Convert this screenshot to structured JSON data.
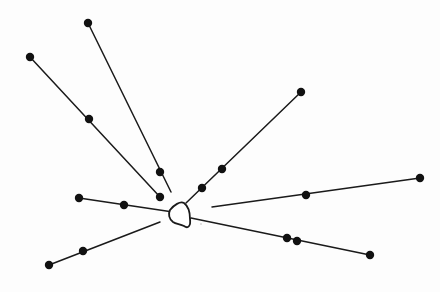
{
  "diagram": {
    "title": "",
    "width": 440,
    "height": 292,
    "background": "#fdfdfd",
    "stroke_color": "#1a1a1a",
    "node_color": "#111111",
    "center": {
      "name": "central-body",
      "path": "M170,210 C174,205 180,201 184,203 C188,206 190,212 190,219 C191,226 188,229 184,226 C180,224 176,224 173,222 C169,219 168,214 170,210 Z"
    },
    "rays": [
      {
        "name": "ray-upper-left-steep",
        "points": [
          [
            88,
            23
          ],
          [
            171,
            192
          ]
        ],
        "nodes": [
          [
            88,
            23
          ],
          [
            160,
            172
          ]
        ]
      },
      {
        "name": "ray-upper-left",
        "points": [
          [
            30,
            57
          ],
          [
            160,
            197
          ]
        ],
        "nodes": [
          [
            30,
            57
          ],
          [
            89,
            119
          ],
          [
            160,
            197
          ]
        ]
      },
      {
        "name": "ray-upper-right",
        "points": [
          [
            301,
            92
          ],
          [
            186,
            203
          ]
        ],
        "nodes": [
          [
            301,
            92
          ],
          [
            222,
            169
          ],
          [
            202,
            188
          ]
        ]
      },
      {
        "name": "ray-left",
        "points": [
          [
            79,
            198
          ],
          [
            173,
            212
          ]
        ],
        "nodes": [
          [
            79,
            198
          ],
          [
            124,
            205
          ]
        ]
      },
      {
        "name": "ray-lower-left",
        "points": [
          [
            49,
            265
          ],
          [
            160,
            222
          ]
        ],
        "nodes": [
          [
            49,
            265
          ],
          [
            83,
            251
          ]
        ]
      },
      {
        "name": "ray-right",
        "points": [
          [
            212,
            207
          ],
          [
            420,
            178
          ]
        ],
        "nodes": [
          [
            306,
            195
          ],
          [
            420,
            178
          ]
        ]
      },
      {
        "name": "ray-lower-right",
        "points": [
          [
            191,
            218
          ],
          [
            370,
            255
          ]
        ],
        "nodes": [
          [
            287,
            238
          ],
          [
            297,
            241
          ],
          [
            370,
            255
          ]
        ]
      }
    ],
    "node_radius": 4.2,
    "stray_marks": [
      [
        201,
        224
      ]
    ]
  }
}
